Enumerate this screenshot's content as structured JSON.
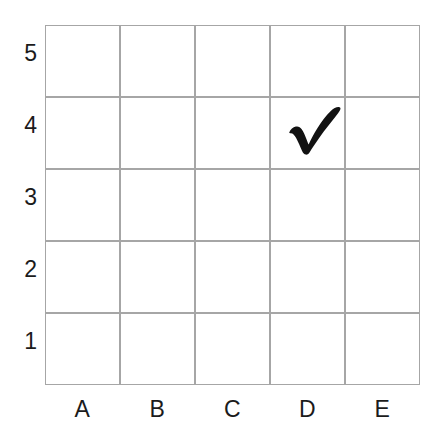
{
  "figure": {
    "name": "coordinate-grid-with-checkmark",
    "background_color": "#ffffff",
    "grid_line_color": "#a6a6a6",
    "label_color": "#1b1b1b",
    "mark_color": "#121212"
  },
  "grid": {
    "columns": 5,
    "rows": 5,
    "column_labels": [
      "A",
      "B",
      "C",
      "D",
      "E"
    ],
    "row_labels_top_to_bottom": [
      "5",
      "4",
      "3",
      "2",
      "1"
    ],
    "row_labels_bottom_to_top": [
      "1",
      "2",
      "3",
      "4",
      "5"
    ],
    "cells": [
      [
        {
          "id": "A5",
          "content": ""
        },
        {
          "id": "B5",
          "content": ""
        },
        {
          "id": "C5",
          "content": ""
        },
        {
          "id": "D5",
          "content": ""
        },
        {
          "id": "E5",
          "content": ""
        }
      ],
      [
        {
          "id": "A4",
          "content": ""
        },
        {
          "id": "B4",
          "content": ""
        },
        {
          "id": "C4",
          "content": ""
        },
        {
          "id": "D4",
          "content": "checkmark"
        },
        {
          "id": "E4",
          "content": ""
        }
      ],
      [
        {
          "id": "A3",
          "content": ""
        },
        {
          "id": "B3",
          "content": ""
        },
        {
          "id": "C3",
          "content": ""
        },
        {
          "id": "D3",
          "content": ""
        },
        {
          "id": "E3",
          "content": ""
        }
      ],
      [
        {
          "id": "A2",
          "content": ""
        },
        {
          "id": "B2",
          "content": ""
        },
        {
          "id": "C2",
          "content": ""
        },
        {
          "id": "D2",
          "content": ""
        },
        {
          "id": "E2",
          "content": ""
        }
      ],
      [
        {
          "id": "A1",
          "content": ""
        },
        {
          "id": "B1",
          "content": ""
        },
        {
          "id": "C1",
          "content": ""
        },
        {
          "id": "D1",
          "content": ""
        },
        {
          "id": "E1",
          "content": ""
        }
      ]
    ]
  },
  "mark": {
    "icon": "checkmark-icon",
    "cell": "D4",
    "column": "D",
    "row": "4",
    "color": "#121212"
  }
}
